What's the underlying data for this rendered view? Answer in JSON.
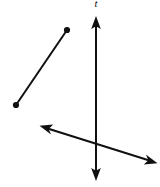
{
  "figure": {
    "width": 160,
    "height": 187,
    "background_color": "#ffffff",
    "stroke_color": "#101010",
    "labels": {
      "vertical_line": "t"
    },
    "objects": [
      {
        "id": "vertical-line",
        "kind": "line",
        "label": "t",
        "arrowheads": "both",
        "endpoint_dots": "none",
        "from": {
          "x": 96,
          "y": 17
        },
        "to": {
          "x": 96,
          "y": 180
        }
      },
      {
        "id": "line-segment",
        "kind": "segment",
        "label": "",
        "arrowheads": "none",
        "endpoint_dots": "both",
        "from": {
          "x": 16,
          "y": 105
        },
        "to": {
          "x": 67,
          "y": 30
        }
      },
      {
        "id": "transversal-line",
        "kind": "line",
        "label": "",
        "arrowheads": "both",
        "endpoint_dots": "none",
        "from": {
          "x": 40,
          "y": 126
        },
        "to": {
          "x": 157,
          "y": 163
        }
      }
    ],
    "intersection": {
      "x": 96,
      "y": 147
    },
    "label_position": {
      "x": 96,
      "y": 7
    }
  }
}
